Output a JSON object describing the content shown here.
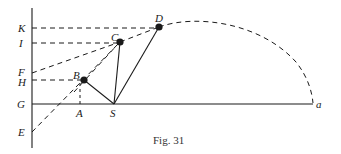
{
  "figure": {
    "caption": "Fig. 31",
    "points": {
      "K": "K",
      "I": "I",
      "F": "F",
      "H": "H",
      "G": "G",
      "E": "E",
      "A": "A",
      "B": "B",
      "C": "C",
      "D": "D",
      "S": "S",
      "a": "a"
    }
  },
  "colors": {
    "ink": "#1a1a1a",
    "background": "#ffffff"
  }
}
